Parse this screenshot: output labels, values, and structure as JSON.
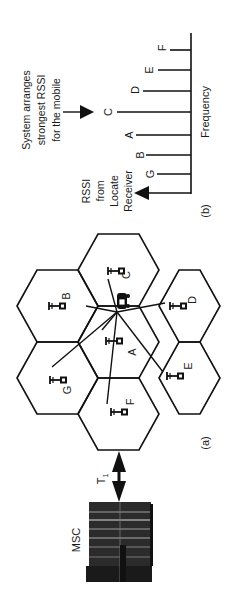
{
  "figure": {
    "panel_a_label": "(a)",
    "panel_b_label": "(b)",
    "msc_label": "MSC",
    "link_label": "T",
    "link_subscript": "1"
  },
  "cells": [
    {
      "id": "A",
      "label": "A"
    },
    {
      "id": "B",
      "label": "B"
    },
    {
      "id": "C",
      "label": "C"
    },
    {
      "id": "D",
      "label": "D"
    },
    {
      "id": "E",
      "label": "E"
    },
    {
      "id": "F",
      "label": "F"
    },
    {
      "id": "G",
      "label": "G"
    }
  ],
  "spectrum": {
    "axis_label": "Frequency",
    "receiver_label_lines": [
      "RSSI",
      "from",
      "Locate",
      "Receiver"
    ],
    "annotation_lines": [
      "System arranges",
      "strongest RSSI",
      "for the mobile"
    ],
    "bars": [
      {
        "label": "G",
        "strength": 34
      },
      {
        "label": "B",
        "strength": 45
      },
      {
        "label": "A",
        "strength": 55
      },
      {
        "label": "C",
        "strength": 74
      },
      {
        "label": "D",
        "strength": 48
      },
      {
        "label": "E",
        "strength": 33
      },
      {
        "label": "F",
        "strength": 21
      }
    ],
    "strongest": "C"
  },
  "colors": {
    "ink": "#111111",
    "background": "#ffffff"
  }
}
